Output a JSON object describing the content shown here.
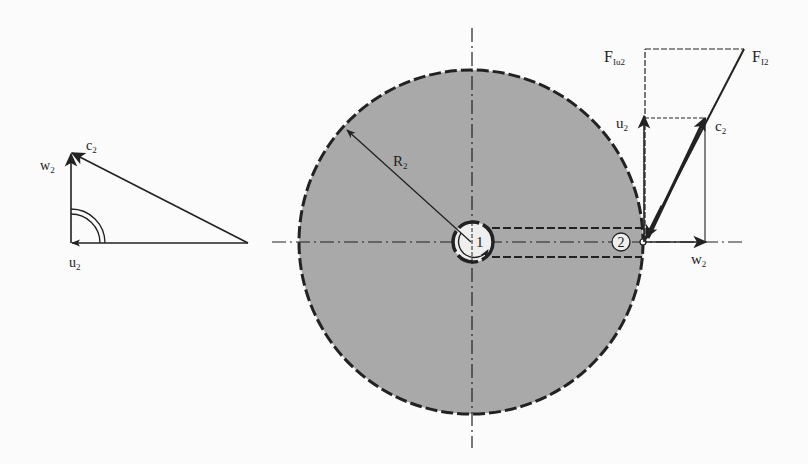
{
  "diagram": {
    "type": "turbomachine rotor outlet velocity diagram",
    "colors": {
      "background": "#fbfbfb",
      "disk_fill": "#a9a9a9",
      "line": "#222222",
      "hub_fill": "#efefef"
    },
    "left_triangle": {
      "labels": {
        "c": "c",
        "c_sub": "2",
        "w": "w",
        "w_sub": "2",
        "u": "u",
        "u_sub": "2"
      }
    },
    "disk": {
      "radius_label": "R",
      "radius_sub": "2",
      "hub_label": "1",
      "point_label": "2"
    },
    "right_diagram": {
      "labels": {
        "F_Iu2": "F",
        "F_Iu2_sub": "Iu2",
        "F_I2": "F",
        "F_I2_sub": "I2",
        "u": "u",
        "u_sub": "2",
        "c": "c",
        "c_sub": "2",
        "w": "w",
        "w_sub": "2"
      }
    }
  }
}
